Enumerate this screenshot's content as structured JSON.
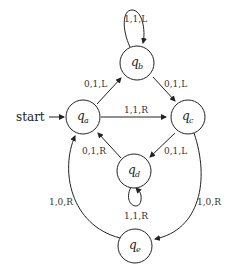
{
  "diagram": {
    "start_label": "start",
    "states": [
      {
        "id": "qa",
        "name": "q",
        "sub": "a"
      },
      {
        "id": "qb",
        "name": "q",
        "sub": "b"
      },
      {
        "id": "qc",
        "name": "q",
        "sub": "c"
      },
      {
        "id": "qd",
        "name": "q",
        "sub": "d"
      },
      {
        "id": "qe",
        "name": "q",
        "sub": "e"
      }
    ],
    "transitions": [
      {
        "from": "qb",
        "to": "qb",
        "label": "1,1,L"
      },
      {
        "from": "qa",
        "to": "qb",
        "label": "0,1,L"
      },
      {
        "from": "qb",
        "to": "qc",
        "label": "0,1,L"
      },
      {
        "from": "qa",
        "to": "qc",
        "label": "1,1,R"
      },
      {
        "from": "qd",
        "to": "qa",
        "label": "0,1,R"
      },
      {
        "from": "qc",
        "to": "qd",
        "label": "0,1,L"
      },
      {
        "from": "qd",
        "to": "qd",
        "label": "1,1,R"
      },
      {
        "from": "qe",
        "to": "qa",
        "label": "1,0,R"
      },
      {
        "from": "qc",
        "to": "qe",
        "label": "1,0,R"
      }
    ]
  }
}
